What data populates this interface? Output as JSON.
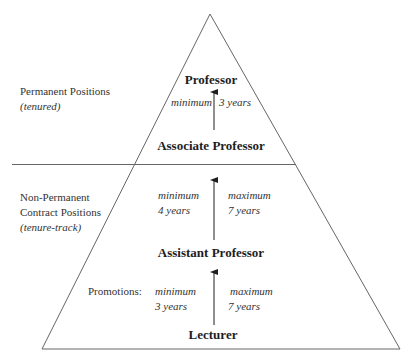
{
  "diagram": {
    "type": "pyramid",
    "colors": {
      "line": "#555555",
      "text": "#2a2a2a",
      "background": "#ffffff"
    },
    "sections": {
      "permanent": {
        "label": "Permanent Positions",
        "sublabel": "(tenured)"
      },
      "non_permanent": {
        "label_line1": "Non-Permanent",
        "label_line2": "Contract Positions",
        "sublabel": "(tenure-track)"
      }
    },
    "promotions_label": "Promotions:",
    "ranks": [
      {
        "name": "Professor"
      },
      {
        "name": "Associate Professor"
      },
      {
        "name": "Assistant Professor"
      },
      {
        "name": "Lecturer"
      }
    ],
    "transitions": [
      {
        "from": "Associate Professor",
        "to": "Professor",
        "min_label": "minimum",
        "min_value": "3 years"
      },
      {
        "from": "Assistant Professor",
        "to": "Associate Professor",
        "min_label": "minimum",
        "min_value": "4 years",
        "max_label": "maximum",
        "max_value": "7 years"
      },
      {
        "from": "Lecturer",
        "to": "Assistant Professor",
        "min_label": "minimum",
        "min_value": "3 years",
        "max_label": "maximum",
        "max_value": "7 years"
      }
    ]
  }
}
